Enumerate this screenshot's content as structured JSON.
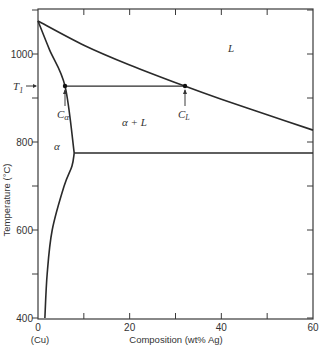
{
  "chart_data": {
    "type": "line",
    "title": "",
    "xlabel": "Composition (wt% Ag)",
    "ylabel": "Temperature (°C)",
    "x_end_label": "(Cu)",
    "xlim": [
      0,
      60
    ],
    "ylim": [
      400,
      1150
    ],
    "x_ticks": [
      0,
      10,
      20,
      30,
      40,
      50,
      60
    ],
    "x_tick_labels": [
      "0",
      "20",
      "40",
      "60"
    ],
    "x_tick_label_values": [
      0,
      20,
      40,
      60
    ],
    "y_ticks": [
      400,
      500,
      600,
      700,
      800,
      900,
      1000,
      1100
    ],
    "y_tick_labels": [
      "400",
      "600",
      "800",
      "1000"
    ],
    "y_tick_label_values": [
      400,
      600,
      800,
      1000
    ],
    "grid": false,
    "series": [
      {
        "name": "Liquidus",
        "x": [
          0,
          10,
          20,
          32,
          40,
          50,
          60
        ],
        "y": [
          1075,
          1020,
          975,
          927,
          897,
          862,
          827
        ]
      },
      {
        "name": "Solidus",
        "x": [
          0,
          2.5,
          5.9,
          7.9
        ],
        "y": [
          1075,
          1010,
          927,
          775
        ]
      },
      {
        "name": "Solvus",
        "x": [
          7.9,
          7.4,
          5.7,
          3.1,
          2.0,
          1.5
        ],
        "y": [
          775,
          745,
          700,
          600,
          500,
          400
        ]
      },
      {
        "name": "Eutectic isotherm",
        "x": [
          7.9,
          60
        ],
        "y": [
          775,
          775
        ]
      },
      {
        "name": "Tie line at T1",
        "x": [
          5.9,
          32
        ],
        "y": [
          927,
          927
        ]
      }
    ],
    "annotations": [
      {
        "text": "L",
        "x": 42,
        "y": 1070,
        "role": "phase-label"
      },
      {
        "text": "α + L",
        "x": 21,
        "y": 890,
        "role": "phase-label"
      },
      {
        "text": "α",
        "x": 1.8,
        "y": 790,
        "role": "phase-label"
      },
      {
        "text": "T1",
        "x": -2,
        "y": 927,
        "role": "temperature-marker"
      },
      {
        "text": "Cα",
        "x": 5.9,
        "y": 927,
        "role": "composition-marker"
      },
      {
        "text": "CL",
        "x": 32,
        "y": 927,
        "role": "composition-marker"
      }
    ],
    "tie_line": {
      "temperature_label": "T1",
      "T": 927,
      "C_alpha": 5.9,
      "C_L": 32
    }
  },
  "labels": {
    "phase_L": "L",
    "phase_alpha_L": "α + L",
    "phase_alpha": "α",
    "T1_main": "T",
    "T1_sub": "1",
    "C_alpha_main": "C",
    "C_alpha_sub": "α",
    "C_L_main": "C",
    "C_L_sub": "L",
    "xlabel": "Composition (wt% Ag)",
    "ylabel": "Temperature (°C)",
    "cu": "(Cu)"
  }
}
